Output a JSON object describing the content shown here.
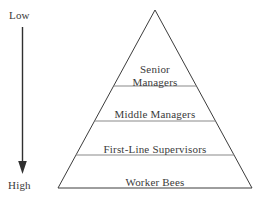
{
  "diagram": {
    "type": "pyramid-hierarchy",
    "background_color": "#ffffff",
    "outline_color": "#3c3c3c",
    "divider_color": "#8a8a8a",
    "text_color": "#3a3a3a",
    "tiers": [
      {
        "label": "Senior\nManagers",
        "name": "senior-managers"
      },
      {
        "label": "Middle Managers",
        "name": "middle-managers"
      },
      {
        "label": "First-Line Supervisors",
        "name": "first-line-supervisors"
      },
      {
        "label": "Worker Bees",
        "name": "worker-bees"
      }
    ]
  },
  "axis": {
    "top_label": "Low",
    "bottom_label": "High",
    "direction": "downward",
    "arrow_color": "#2f2f2f"
  }
}
